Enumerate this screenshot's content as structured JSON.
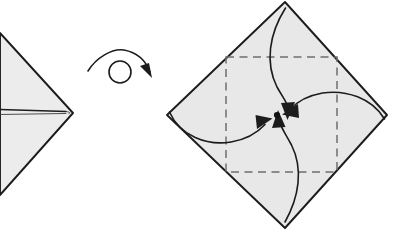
{
  "figure": {
    "kind": "origami-folding-diagram",
    "canvas": {
      "width": 393,
      "height": 234,
      "background": "#ffffff"
    },
    "palette": {
      "paper_fill": "#ececec",
      "paper_fill_shaded": "#e8e8e8",
      "edge_stroke": "#1c1c1c",
      "crease_stroke": "#6d6d6d",
      "arrow_stroke": "#1c1c1c",
      "center_dot": "#111111"
    }
  },
  "panels": [
    {
      "id": "left-panel",
      "name": "previous-step-model",
      "label": "partially folded model, cropped at left edge",
      "shape": "diamond-cropped",
      "outline_points": "0,33 73,113 0,195",
      "vertices": {
        "right": {
          "x": 73,
          "y": 113
        },
        "top_cut": {
          "x": 0,
          "y": 33
        },
        "bottom_cut": {
          "x": 0,
          "y": 195
        }
      },
      "open_edge": {
        "name": "horizontal-open-edge",
        "from": {
          "x": 0,
          "y": 110
        },
        "to": {
          "x": 68,
          "y": 112
        },
        "style": "double-thin-line"
      }
    },
    {
      "id": "turn-over-symbol",
      "name": "turn-over-arrow",
      "label": "turn the model over",
      "circle": {
        "cx": 120,
        "cy": 72,
        "r": 11
      },
      "arc_path": "M 88,71 C 96,58 112,48 124,50 C 140,53 147,64 150,72",
      "arrow_head_points": "150,78 144,66 153,65",
      "arrow_head_rotation_deg": 28
    },
    {
      "id": "right-panel",
      "name": "next-step-model",
      "label": "square turned over with four corners folded to center",
      "shape": "diamond",
      "outline_points": "285,2 387,115 285,228 167,115",
      "vertices": {
        "top": {
          "x": 285,
          "y": 2
        },
        "right": {
          "x": 387,
          "y": 115
        },
        "bottom": {
          "x": 285,
          "y": 228
        },
        "left": {
          "x": 167,
          "y": 115
        }
      },
      "crease_square": {
        "name": "dashed-center-square",
        "x": 226,
        "y": 57,
        "width": 111,
        "height": 115,
        "style": "dashed"
      },
      "center_point": {
        "name": "center-dot",
        "x": 277,
        "y": 115,
        "r": 3.1
      },
      "fold_arrows": [
        {
          "name": "fold-arrow-from-top",
          "from_vertex": "top",
          "path": "M 285,8 C 270,34 266,62 278,86 C 286,100 289,104 289,110",
          "head_points": "288,119 282,103 295,103",
          "head_angle_deg": 178
        },
        {
          "name": "fold-arrow-from-right",
          "from_vertex": "right",
          "path": "M 384,119 C 372,98 346,90 323,93 C 307,96 296,103 291,109",
          "head_points": "283,114 298,104 299,117",
          "head_angle_deg": 270
        },
        {
          "name": "fold-arrow-from-left",
          "from_vertex": "left",
          "path": "M 170,112 C 180,135 206,145 230,142 C 248,139 259,131 265,124",
          "head_points": "272,119 258,129 256,116",
          "head_angle_deg": 90
        },
        {
          "name": "fold-arrow-from-bottom",
          "from_vertex": "bottom",
          "path": "M 285,222 C 299,196 303,168 291,144 C 284,131 280,126 279,120",
          "head_points": "278,111 285,127 272,127",
          "head_angle_deg": 0
        }
      ]
    }
  ]
}
